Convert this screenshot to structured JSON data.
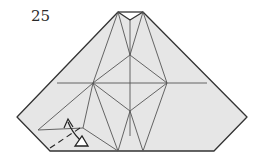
{
  "diagram": {
    "type": "origami-step",
    "step_number": "25",
    "colors": {
      "paper_fill": "#e6e6e6",
      "edge": "#333333",
      "crease": "#555555",
      "arrow": "#222222",
      "background": "#ffffff"
    },
    "symbols": [
      "valley-fold-dashed-line",
      "fold-arrow",
      "open-triangle-arrowhead"
    ]
  }
}
